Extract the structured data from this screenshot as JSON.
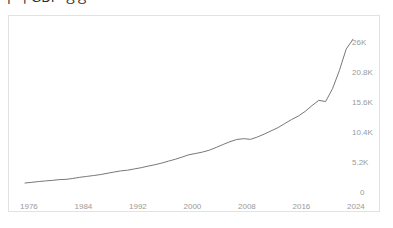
{
  "chart_title": "누적 GDP 성장",
  "axis": {
    "y_labels": [
      "26K",
      "20.8K",
      "15.6K",
      "10.4K",
      "5.2K",
      "0"
    ],
    "y_label_values": [
      26000,
      20800,
      15600,
      10400,
      5200,
      0
    ],
    "x_labels": [
      "1976",
      "1984",
      "1992",
      "2000",
      "2008",
      "2016",
      "2024"
    ],
    "x_label_values": [
      1976,
      1984,
      1992,
      2000,
      2008,
      2016,
      2024
    ]
  },
  "style": {
    "line_color": "#787878",
    "frame_color": "#e2e2e2",
    "tick_text_color": "#9a9a9a",
    "title_color": "#2b2b2b",
    "background": "#ffffff"
  },
  "chart_data": {
    "type": "line",
    "title": "누적 GDP 성장",
    "xlabel": "",
    "ylabel": "",
    "xlim": [
      1976,
      2024
    ],
    "ylim": [
      0,
      28000
    ],
    "grid": false,
    "legend": "none",
    "x_tick_labels": [
      "1976",
      "1984",
      "1992",
      "2000",
      "2008",
      "2016",
      "2024"
    ],
    "y_tick_labels": [
      "0",
      "5.2K",
      "10.4K",
      "15.6K",
      "20.8K",
      "26K"
    ],
    "y_axis_position": "right",
    "annotations": [],
    "series": [
      {
        "name": "누적 GDP",
        "x": [
          1976,
          1977,
          1978,
          1979,
          1980,
          1981,
          1982,
          1983,
          1984,
          1985,
          1986,
          1987,
          1988,
          1989,
          1990,
          1991,
          1992,
          1993,
          1994,
          1995,
          1996,
          1997,
          1998,
          1999,
          2000,
          2001,
          2002,
          2003,
          2004,
          2005,
          2006,
          2007,
          2008,
          2009,
          2010,
          2011,
          2012,
          2013,
          2014,
          2015,
          2016,
          2017,
          2018,
          2019,
          2020,
          2021,
          2022,
          2023,
          2024
        ],
        "values": [
          1200,
          1320,
          1450,
          1560,
          1650,
          1780,
          1830,
          1980,
          2180,
          2330,
          2480,
          2640,
          2860,
          3080,
          3280,
          3400,
          3620,
          3830,
          4100,
          4340,
          4620,
          4960,
          5280,
          5660,
          6060,
          6280,
          6520,
          6850,
          7320,
          7820,
          8300,
          8680,
          8820,
          8700,
          9100,
          9600,
          10150,
          10700,
          11400,
          12100,
          12700,
          13500,
          14500,
          15400,
          15200,
          17400,
          20500,
          24200,
          25900
        ]
      }
    ]
  }
}
